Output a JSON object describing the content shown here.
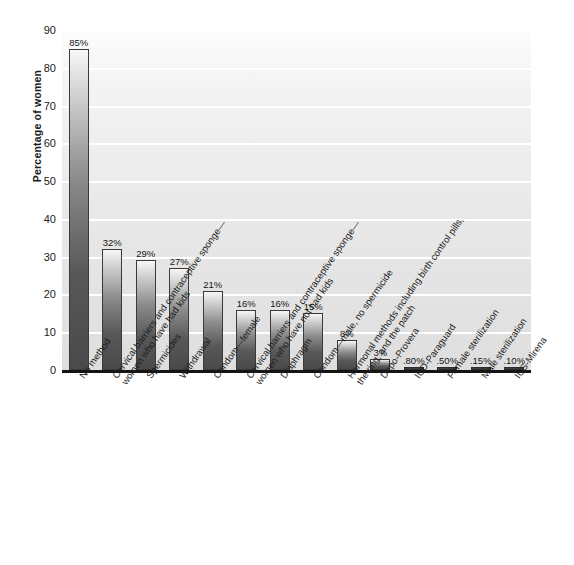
{
  "chart_data": {
    "type": "bar",
    "title": "",
    "xlabel": "",
    "ylabel": "Percentage of women",
    "ylim": [
      0,
      90
    ],
    "yticks": [
      0,
      10,
      20,
      30,
      40,
      50,
      60,
      70,
      80,
      90
    ],
    "grid": true,
    "legend": "none",
    "orientation": "vertical",
    "label_rotation_deg": -55,
    "categories": [
      "No method",
      "Cervical barriers and contraceptive sponge—women who have had kids",
      "Spermicides",
      "Withdrawal",
      "Condom—female",
      "Cervical barriers and contraceptive sponge—women who have not had kids",
      "Diaphragm",
      "Condom—male, no spermicide",
      "Hormonal methods including birth control pills, the ring, and the patch",
      "Depo-Provera",
      "IUD-Paraguard",
      "Female sterilization",
      "Male sterilization",
      "IUS-Mirena"
    ],
    "values": [
      85,
      32,
      29,
      27,
      21,
      16,
      16,
      15,
      8,
      3,
      0.8,
      0.5,
      0.15,
      0.1
    ],
    "value_labels": [
      "85%",
      "32%",
      "29%",
      "27%",
      "21%",
      "16%",
      "16%",
      "15%",
      "8%",
      "3%",
      ".80%",
      ".50%",
      ".15%",
      ".10%"
    ],
    "colors": {
      "bar_top": "#f7f7f7",
      "bar_bottom": "#4a4a4a",
      "bar_outline": "#3a3a3a",
      "plot_background_top": "#fcfcfc",
      "plot_background_bottom": "#dedede",
      "gridline": "#ffffff",
      "axis": "#141414",
      "text": "#1a1a1a",
      "page_background": "#ffffff"
    }
  },
  "axis": {
    "y_title": "Percentage of women",
    "y_tick_labels": [
      "90",
      "80",
      "70",
      "60",
      "50",
      "40",
      "30",
      "20",
      "10",
      "0"
    ]
  },
  "x_axis_label_lines": [
    [
      "No method",
      ""
    ],
    [
      "Cervical barriers and contraceptive sponge—",
      "women who have had kids"
    ],
    [
      "Spermicides",
      ""
    ],
    [
      "Withdrawal",
      ""
    ],
    [
      "Condom—female",
      ""
    ],
    [
      "Cervical barriers and contraceptive sponge—",
      "women who have not had kids"
    ],
    [
      "Diaphragm",
      ""
    ],
    [
      "Condom—male, no spermicide",
      ""
    ],
    [
      "Hormonal methods including birth control pills,",
      "the ring, and the patch"
    ],
    [
      "Depo-Provera",
      ""
    ],
    [
      "IUD-Paraguard",
      ""
    ],
    [
      "Female sterilization",
      ""
    ],
    [
      "Male sterilization",
      ""
    ],
    [
      "IUS-Mirena",
      ""
    ]
  ]
}
